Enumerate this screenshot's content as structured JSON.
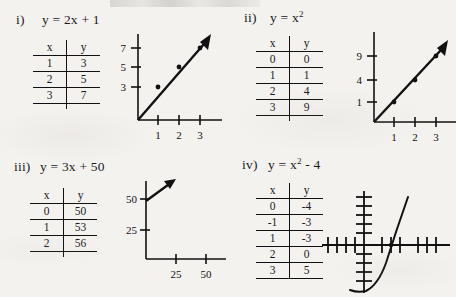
{
  "page": {
    "background_color": "#f4f2ef",
    "ink_color": "#111111"
  },
  "panels": [
    {
      "id": "i",
      "number_label": "i)",
      "equation_plain": "y = 2x + 1",
      "equation_parts": {
        "lhs": "y =",
        "rhs": "2x + 1",
        "exponent": ""
      },
      "table": {
        "headers": [
          "x",
          "y"
        ],
        "rows": [
          [
            "1",
            "3"
          ],
          [
            "2",
            "5"
          ],
          [
            "3",
            "7"
          ]
        ]
      },
      "graph": {
        "type": "line",
        "x_ticks": [
          "1",
          "2",
          "3"
        ],
        "y_ticks": [
          "3",
          "5",
          "7"
        ],
        "points": [
          [
            1,
            3
          ],
          [
            2,
            5
          ],
          [
            3,
            7
          ]
        ],
        "arrow": true
      }
    },
    {
      "id": "ii",
      "number_label": "ii)",
      "equation_plain": "y = x2",
      "equation_parts": {
        "lhs": "y =",
        "rhs": "x",
        "exponent": "2"
      },
      "table": {
        "headers": [
          "x",
          "y"
        ],
        "rows": [
          [
            "0",
            "0"
          ],
          [
            "1",
            "1"
          ],
          [
            "2",
            "4"
          ],
          [
            "3",
            "9"
          ]
        ]
      },
      "graph": {
        "type": "line",
        "x_ticks": [
          "1",
          "2",
          "3"
        ],
        "y_ticks": [
          "1",
          "4",
          "9"
        ],
        "points": [
          [
            1,
            1
          ],
          [
            2,
            4
          ],
          [
            3,
            9
          ]
        ],
        "arrow": true
      }
    },
    {
      "id": "iii",
      "number_label": "iii)",
      "equation_plain": "y = 3x + 50",
      "equation_parts": {
        "lhs": "y =",
        "rhs": "3x + 50",
        "exponent": ""
      },
      "table": {
        "headers": [
          "x",
          "y"
        ],
        "rows": [
          [
            "0",
            "50"
          ],
          [
            "1",
            "53"
          ],
          [
            "2",
            "56"
          ]
        ]
      },
      "graph": {
        "type": "line",
        "x_ticks": [
          "25",
          "50"
        ],
        "y_ticks": [
          "25",
          "50"
        ],
        "points": [],
        "arrow": true
      }
    },
    {
      "id": "iv",
      "number_label": "iv)",
      "equation_plain": "y = x2 - 4",
      "equation_parts": {
        "lhs": "y =",
        "rhs": "x",
        "exponent": "2",
        "tail": "- 4"
      },
      "table": {
        "headers": [
          "x",
          "y"
        ],
        "rows": [
          [
            "0",
            "-4"
          ],
          [
            "-1",
            "-3"
          ],
          [
            "1",
            "-3"
          ],
          [
            "2",
            "0"
          ],
          [
            "3",
            "5"
          ]
        ]
      },
      "graph": {
        "type": "parabola",
        "x_ticks": [],
        "y_ticks": [],
        "points": [],
        "arrow": false
      }
    }
  ]
}
